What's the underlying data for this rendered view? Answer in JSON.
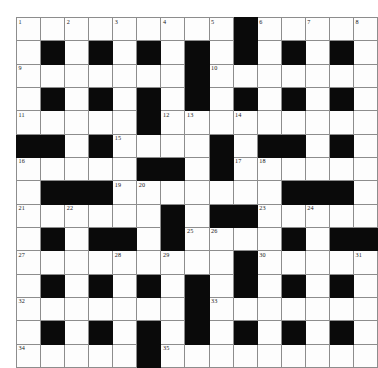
{
  "puzzle": {
    "kind": "crossword-grid",
    "title": "Crossword puzzle grid",
    "rows": 15,
    "columns": 15,
    "colors": {
      "block": "#0a0a0a",
      "cell": "#fdfdfd",
      "gridline": "#8d8d8d",
      "border": "#6b6b6b",
      "number": "#1a1a1a"
    },
    "legend": {
      "0": "open (white) cell",
      "1": "blocked (black) cell"
    },
    "grid": [
      [
        0,
        0,
        0,
        0,
        0,
        0,
        0,
        0,
        0,
        1,
        0,
        0,
        0,
        0,
        0
      ],
      [
        0,
        1,
        0,
        1,
        0,
        1,
        0,
        1,
        0,
        1,
        0,
        1,
        0,
        1,
        0
      ],
      [
        0,
        0,
        0,
        0,
        0,
        0,
        0,
        1,
        0,
        0,
        0,
        0,
        0,
        0,
        0
      ],
      [
        0,
        1,
        0,
        1,
        0,
        1,
        0,
        1,
        0,
        1,
        0,
        1,
        0,
        1,
        0
      ],
      [
        0,
        0,
        0,
        0,
        0,
        1,
        0,
        0,
        0,
        0,
        0,
        0,
        0,
        0,
        0
      ],
      [
        1,
        1,
        0,
        1,
        0,
        0,
        0,
        0,
        1,
        0,
        1,
        1,
        0,
        1,
        0
      ],
      [
        0,
        0,
        0,
        0,
        0,
        1,
        1,
        0,
        1,
        0,
        0,
        0,
        0,
        0,
        0
      ],
      [
        0,
        1,
        1,
        1,
        0,
        0,
        0,
        0,
        0,
        0,
        0,
        1,
        1,
        1,
        0
      ],
      [
        0,
        0,
        0,
        0,
        0,
        0,
        1,
        0,
        1,
        1,
        0,
        0,
        0,
        0,
        0
      ],
      [
        0,
        1,
        0,
        1,
        1,
        0,
        1,
        0,
        0,
        0,
        0,
        1,
        0,
        1,
        1
      ],
      [
        0,
        0,
        0,
        0,
        0,
        0,
        0,
        0,
        0,
        1,
        0,
        0,
        0,
        0,
        0
      ],
      [
        0,
        1,
        0,
        1,
        0,
        1,
        0,
        1,
        0,
        1,
        0,
        1,
        0,
        1,
        0
      ],
      [
        0,
        0,
        0,
        0,
        0,
        0,
        0,
        1,
        0,
        0,
        0,
        0,
        0,
        0,
        0
      ],
      [
        0,
        1,
        0,
        1,
        0,
        1,
        0,
        1,
        0,
        1,
        0,
        1,
        0,
        1,
        0
      ],
      [
        0,
        0,
        0,
        0,
        0,
        1,
        0,
        0,
        0,
        0,
        0,
        0,
        0,
        0,
        0
      ]
    ],
    "numbers": [
      {
        "n": "1",
        "row": 1,
        "col": 1
      },
      {
        "n": "2",
        "row": 1,
        "col": 3
      },
      {
        "n": "3",
        "row": 1,
        "col": 5
      },
      {
        "n": "4",
        "row": 1,
        "col": 7
      },
      {
        "n": "5",
        "row": 1,
        "col": 9
      },
      {
        "n": "6",
        "row": 1,
        "col": 11
      },
      {
        "n": "7",
        "row": 1,
        "col": 13
      },
      {
        "n": "8",
        "row": 1,
        "col": 15
      },
      {
        "n": "9",
        "row": 3,
        "col": 1
      },
      {
        "n": "10",
        "row": 3,
        "col": 9
      },
      {
        "n": "11",
        "row": 5,
        "col": 1
      },
      {
        "n": "12",
        "row": 5,
        "col": 7
      },
      {
        "n": "13",
        "row": 5,
        "col": 8
      },
      {
        "n": "14",
        "row": 5,
        "col": 10
      },
      {
        "n": "15",
        "row": 6,
        "col": 5
      },
      {
        "n": "16",
        "row": 7,
        "col": 1
      },
      {
        "n": "17",
        "row": 7,
        "col": 10
      },
      {
        "n": "18",
        "row": 7,
        "col": 11
      },
      {
        "n": "19",
        "row": 8,
        "col": 5
      },
      {
        "n": "20",
        "row": 8,
        "col": 6
      },
      {
        "n": "21",
        "row": 9,
        "col": 1
      },
      {
        "n": "22",
        "row": 9,
        "col": 3
      },
      {
        "n": "23",
        "row": 9,
        "col": 11
      },
      {
        "n": "24",
        "row": 9,
        "col": 13
      },
      {
        "n": "25",
        "row": 10,
        "col": 8
      },
      {
        "n": "26",
        "row": 10,
        "col": 9
      },
      {
        "n": "27",
        "row": 11,
        "col": 1
      },
      {
        "n": "28",
        "row": 11,
        "col": 5
      },
      {
        "n": "29",
        "row": 11,
        "col": 7
      },
      {
        "n": "30",
        "row": 11,
        "col": 11
      },
      {
        "n": "31",
        "row": 11,
        "col": 15
      },
      {
        "n": "32",
        "row": 13,
        "col": 1
      },
      {
        "n": "33",
        "row": 13,
        "col": 9
      },
      {
        "n": "34",
        "row": 15,
        "col": 1
      },
      {
        "n": "35",
        "row": 15,
        "col": 7
      }
    ]
  }
}
